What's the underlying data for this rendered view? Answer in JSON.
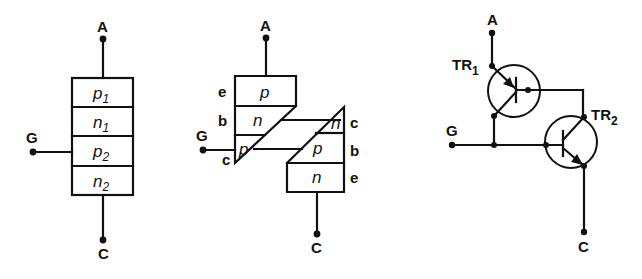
{
  "diagram": {
    "colors": {
      "ink": "#111111",
      "background": "#ffffff"
    }
  },
  "left": {
    "terminals": {
      "anode": "A",
      "gate": "G",
      "cathode": "C"
    },
    "layers": [
      {
        "type": "p",
        "sub": "1"
      },
      {
        "type": "n",
        "sub": "1"
      },
      {
        "type": "p",
        "sub": "2"
      },
      {
        "type": "n",
        "sub": "2"
      }
    ]
  },
  "middle": {
    "terminals": {
      "anode": "A",
      "gate": "G",
      "cathode": "C"
    },
    "upper_transistor": {
      "layers": [
        "p",
        "n",
        "p"
      ],
      "electrodes": [
        "e",
        "b",
        "c"
      ]
    },
    "lower_transistor": {
      "layers": [
        "n",
        "p",
        "n"
      ],
      "electrodes": [
        "c",
        "b",
        "e"
      ]
    }
  },
  "right": {
    "terminals": {
      "anode": "A",
      "gate": "G",
      "cathode": "C"
    },
    "transistors": [
      {
        "name": "TR",
        "sub": "1",
        "type": "pnp"
      },
      {
        "name": "TR",
        "sub": "2",
        "type": "npn"
      }
    ]
  }
}
